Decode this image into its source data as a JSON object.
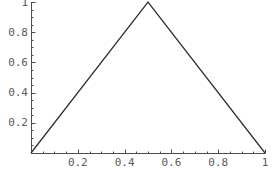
{
  "chart_data": {
    "type": "line",
    "title": "",
    "subtitle": "",
    "xlabel": "",
    "ylabel": "",
    "xlim": [
      0,
      1
    ],
    "ylim": [
      0,
      1
    ],
    "grid": false,
    "legend": null,
    "annotations": [],
    "axis_color": "#4d4d4d",
    "line_color": "#333333",
    "background_color": "#ffffff",
    "tick_label_color": "#5a5a5a",
    "x_ticks": [
      {
        "value": 0.2,
        "label": "0.2"
      },
      {
        "value": 0.4,
        "label": "0.4"
      },
      {
        "value": 0.6,
        "label": "0.6"
      },
      {
        "value": 0.8,
        "label": "0.8"
      },
      {
        "value": 1.0,
        "label": "1"
      }
    ],
    "y_ticks": [
      {
        "value": 0.2,
        "label": "0.2"
      },
      {
        "value": 0.4,
        "label": "0.4"
      },
      {
        "value": 0.6,
        "label": "0.6"
      },
      {
        "value": 0.8,
        "label": "0.8"
      },
      {
        "value": 1.0,
        "label": "1"
      }
    ],
    "x_minor_ticks": [
      0.05,
      0.1,
      0.15,
      0.25,
      0.3,
      0.35,
      0.45,
      0.5,
      0.55,
      0.65,
      0.7,
      0.75,
      0.85,
      0.9,
      0.95
    ],
    "y_minor_ticks": [
      0.05,
      0.1,
      0.15,
      0.25,
      0.3,
      0.35,
      0.45,
      0.5,
      0.55,
      0.65,
      0.7,
      0.75,
      0.85,
      0.9,
      0.95
    ],
    "series": [
      {
        "name": "triangle-wave",
        "x": [
          0,
          0.5,
          1
        ],
        "y": [
          0,
          1,
          0
        ]
      }
    ]
  },
  "geometry": {
    "origin_px": {
      "x": 31,
      "y": 153
    },
    "x_axis_end_px": 265,
    "y_axis_top_px": 2,
    "major_tick_len": 4,
    "minor_tick_len": 2
  }
}
